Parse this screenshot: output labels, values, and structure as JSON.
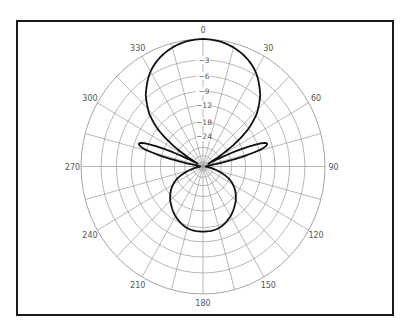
{
  "chart_data": {
    "type": "polar",
    "title": "",
    "angle_unit": "degrees",
    "angle_zero": "top",
    "angle_direction": "clockwise",
    "angle_tick_labels": [
      "0",
      "30",
      "60",
      "90",
      "120",
      "150",
      "180",
      "210",
      "240",
      "270",
      "300",
      "330"
    ],
    "angle_ticks": [
      0,
      30,
      60,
      90,
      120,
      150,
      180,
      210,
      240,
      270,
      300,
      330
    ],
    "spoke_step_deg": 15,
    "radial_tick_labels": [
      "0",
      "-3",
      "-6",
      "-9",
      "-12",
      "-18",
      "-24"
    ],
    "radial_unit": "dB",
    "ring_radii_norm": [
      1.0,
      0.835,
      0.71,
      0.59,
      0.48,
      0.35,
      0.235,
      0.15,
      0.085,
      0.035
    ],
    "radial_label_radii_norm": [
      1.0,
      0.835,
      0.71,
      0.59,
      0.48,
      0.35,
      0.235
    ],
    "series": [
      {
        "name": "Radiation pattern",
        "color": "#111111",
        "points": [
          [
            0,
            1.0
          ],
          [
            10,
            0.985
          ],
          [
            20,
            0.94
          ],
          [
            30,
            0.86
          ],
          [
            40,
            0.73
          ],
          [
            47,
            0.6
          ],
          [
            52,
            0.46
          ],
          [
            56,
            0.3
          ],
          [
            59,
            0.16
          ],
          [
            62,
            0.05
          ],
          [
            64,
            0.12
          ],
          [
            66,
            0.3
          ],
          [
            68,
            0.45
          ],
          [
            70,
            0.54
          ],
          [
            72,
            0.55
          ],
          [
            74,
            0.5
          ],
          [
            76,
            0.38
          ],
          [
            78,
            0.22
          ],
          [
            81,
            0.05
          ],
          [
            95,
            0.03
          ],
          [
            105,
            0.12
          ],
          [
            115,
            0.24
          ],
          [
            125,
            0.32
          ],
          [
            135,
            0.38
          ],
          [
            150,
            0.45
          ],
          [
            165,
            0.5
          ],
          [
            180,
            0.51
          ],
          [
            195,
            0.5
          ],
          [
            210,
            0.45
          ],
          [
            225,
            0.38
          ],
          [
            235,
            0.32
          ],
          [
            245,
            0.24
          ],
          [
            255,
            0.12
          ],
          [
            265,
            0.03
          ],
          [
            279,
            0.05
          ],
          [
            282,
            0.22
          ],
          [
            284,
            0.38
          ],
          [
            286,
            0.5
          ],
          [
            288,
            0.55
          ],
          [
            290,
            0.54
          ],
          [
            292,
            0.45
          ],
          [
            294,
            0.3
          ],
          [
            296,
            0.12
          ],
          [
            298,
            0.05
          ],
          [
            301,
            0.16
          ],
          [
            304,
            0.3
          ],
          [
            308,
            0.46
          ],
          [
            313,
            0.6
          ],
          [
            320,
            0.73
          ],
          [
            330,
            0.86
          ],
          [
            340,
            0.94
          ],
          [
            350,
            0.985
          ],
          [
            360,
            1.0
          ]
        ]
      }
    ],
    "grid": true,
    "legend": null
  },
  "colors": {
    "frame": "#1a1a1a",
    "grid": "#9a9a9a",
    "curve": "#111111",
    "labels": "#555555"
  }
}
